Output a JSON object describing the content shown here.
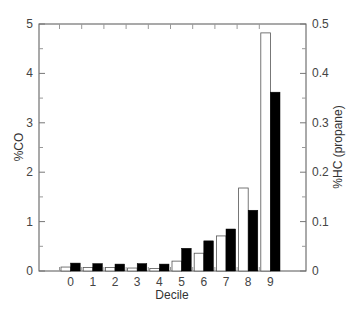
{
  "chart_data": {
    "type": "bar",
    "title": "",
    "xlabel": "Decile",
    "ylabel": "%CO",
    "ylabel_right": "%HC (propane)",
    "categories": [
      "0",
      "1",
      "2",
      "3",
      "4",
      "5",
      "6",
      "7",
      "8",
      "9"
    ],
    "series": [
      {
        "name": "%CO",
        "axis": "left",
        "fill": "#ffffff",
        "stroke": "#555555",
        "values": [
          0.08,
          0.07,
          0.07,
          0.06,
          0.05,
          0.2,
          0.36,
          0.71,
          1.68,
          4.82
        ]
      },
      {
        "name": "%HC (propane)",
        "axis": "right",
        "fill": "#000000",
        "stroke": "#000000",
        "values": [
          0.016,
          0.015,
          0.014,
          0.015,
          0.014,
          0.046,
          0.061,
          0.085,
          0.123,
          0.362
        ]
      }
    ],
    "ylim": [
      0,
      5
    ],
    "ylim_right": [
      0,
      0.5
    ],
    "yticks": [
      "0",
      "1",
      "2",
      "3",
      "4",
      "5"
    ],
    "yticks_right": [
      "0",
      "0.1",
      "0.2",
      "0.3",
      "0.4",
      "0.5"
    ],
    "grid": false,
    "legend": null
  }
}
